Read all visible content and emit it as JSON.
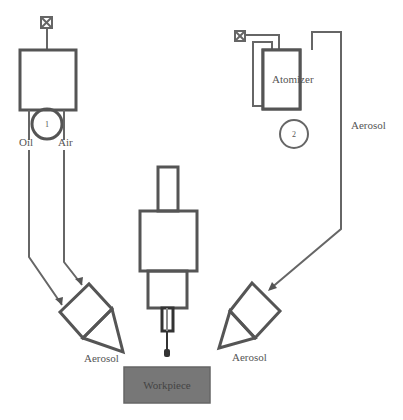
{
  "diagram": {
    "labels": {
      "oil": "Oil",
      "air": "Air",
      "atomizer": "Atomizer",
      "aerosol_pipe": "Aerosol",
      "aerosol_left": "Aerosol",
      "aerosol_right": "Aerosol",
      "workpiece": "Workpiece",
      "pump_1": "1",
      "pump_2": "2"
    },
    "components": [
      {
        "id": "valve-1",
        "type": "valve-icon"
      },
      {
        "id": "reservoir-1",
        "type": "reservoir"
      },
      {
        "id": "pump-1",
        "type": "pump",
        "label": "1"
      },
      {
        "id": "valve-2",
        "type": "valve-icon"
      },
      {
        "id": "atomizer",
        "type": "atomizer"
      },
      {
        "id": "pump-2",
        "type": "pump",
        "label": "2"
      },
      {
        "id": "spindle",
        "type": "spindle"
      },
      {
        "id": "nozzle-left",
        "type": "nozzle"
      },
      {
        "id": "nozzle-right",
        "type": "nozzle"
      },
      {
        "id": "workpiece",
        "type": "workpiece"
      }
    ],
    "colors": {
      "line": "#555555",
      "workpiece_fill": "#777777",
      "workpiece_text": "#444444"
    }
  }
}
